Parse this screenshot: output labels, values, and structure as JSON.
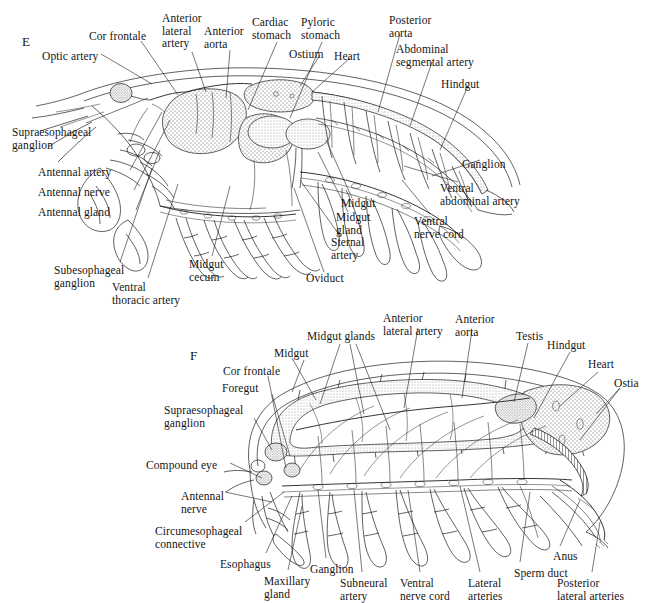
{
  "figure": {
    "panels": [
      {
        "id": "E",
        "letter": "E",
        "subject": "decapod-crustacean-internal-anatomy-lateral",
        "labels": [
          {
            "name": "optic-artery",
            "text": "Optic artery",
            "x": 42,
            "y": 50
          },
          {
            "name": "cor-frontale",
            "text": "Cor frontale",
            "x": 89,
            "y": 30
          },
          {
            "name": "anterior-lateral-artery",
            "text": "Anterior\nlateral\nartery",
            "x": 162,
            "y": 12
          },
          {
            "name": "anterior-aorta",
            "text": "Anterior\naorta",
            "x": 204,
            "y": 25
          },
          {
            "name": "cardiac-stomach",
            "text": "Cardiac\nstomach",
            "x": 252,
            "y": 16
          },
          {
            "name": "pyloric-stomach",
            "text": "Pyloric\nstomach",
            "x": 301,
            "y": 16
          },
          {
            "name": "ostium",
            "text": "Ostium",
            "x": 289,
            "y": 48
          },
          {
            "name": "heart",
            "text": "Heart",
            "x": 334,
            "y": 50
          },
          {
            "name": "posterior-aorta",
            "text": "Posterior\naorta",
            "x": 389,
            "y": 14
          },
          {
            "name": "abdominal-segmental-artery",
            "text": "Abdominal\nsegmental artery",
            "x": 396,
            "y": 43
          },
          {
            "name": "hindgut",
            "text": "Hindgut",
            "x": 441,
            "y": 78
          },
          {
            "name": "supraesophageal-ganglion",
            "text": "Supraesophageal\nganglion",
            "x": 12,
            "y": 126
          },
          {
            "name": "antennal-artery",
            "text": "Antennal artery",
            "x": 38,
            "y": 166
          },
          {
            "name": "antennal-nerve",
            "text": "Antennal nerve",
            "x": 38,
            "y": 186
          },
          {
            "name": "antennal-gland",
            "text": "Antennal gland",
            "x": 38,
            "y": 206
          },
          {
            "name": "subesophageal-ganglion",
            "text": "Subesophageal\nganglion",
            "x": 54,
            "y": 264
          },
          {
            "name": "ventral-thoracic-artery",
            "text": "Ventral\nthoracic artery",
            "x": 112,
            "y": 281
          },
          {
            "name": "midgut-cecum",
            "text": "Midgut\ncecum",
            "x": 189,
            "y": 258
          },
          {
            "name": "oviduct",
            "text": "Oviduct",
            "x": 306,
            "y": 272
          },
          {
            "name": "sternal-artery",
            "text": "Sternal\nartery",
            "x": 331,
            "y": 236
          },
          {
            "name": "midgut-gland",
            "text": "Midgut\ngland",
            "x": 336,
            "y": 211
          },
          {
            "name": "midgut",
            "text": "Midgut",
            "x": 341,
            "y": 197
          },
          {
            "name": "ventral-nerve-cord",
            "text": "Ventral\nnerve cord",
            "x": 414,
            "y": 215
          },
          {
            "name": "ventral-abdominal-artery",
            "text": "Ventral\nabdominal artery",
            "x": 440,
            "y": 182
          },
          {
            "name": "ganglion",
            "text": "Ganglion",
            "x": 462,
            "y": 158
          }
        ]
      },
      {
        "id": "F",
        "letter": "F",
        "subject": "isopod-internal-anatomy-lateral",
        "labels": [
          {
            "name": "midgut-glands",
            "text": "Midgut glands",
            "x": 307,
            "y": 330
          },
          {
            "name": "midgut",
            "text": "Midgut",
            "x": 274,
            "y": 347
          },
          {
            "name": "cor-frontale",
            "text": "Cor frontale",
            "x": 223,
            "y": 365
          },
          {
            "name": "foregut",
            "text": "Foregut",
            "x": 222,
            "y": 382
          },
          {
            "name": "supraesophageal-ganglion",
            "text": "Supraesophageal\nganglion",
            "x": 164,
            "y": 404
          },
          {
            "name": "anterior-lateral-artery",
            "text": "Anterior\nlateral artery",
            "x": 383,
            "y": 312
          },
          {
            "name": "anterior-aorta",
            "text": "Anterior\naorta",
            "x": 455,
            "y": 313
          },
          {
            "name": "testis",
            "text": "Testis",
            "x": 516,
            "y": 330
          },
          {
            "name": "hindgut",
            "text": "Hindgut",
            "x": 547,
            "y": 339
          },
          {
            "name": "heart",
            "text": "Heart",
            "x": 588,
            "y": 358
          },
          {
            "name": "ostia",
            "text": "Ostia",
            "x": 614,
            "y": 377
          },
          {
            "name": "compound-eye",
            "text": "Compound eye",
            "x": 146,
            "y": 459
          },
          {
            "name": "antennal-nerve",
            "text": "Antennal\nnerve",
            "x": 181,
            "y": 490
          },
          {
            "name": "circumesophageal-connective",
            "text": "Circumesophageal\nconnective",
            "x": 155,
            "y": 525
          },
          {
            "name": "esophagus",
            "text": "Esophagus",
            "x": 220,
            "y": 558
          },
          {
            "name": "maxillary-gland",
            "text": "Maxillary\ngland",
            "x": 264,
            "y": 575
          },
          {
            "name": "ganglion",
            "text": "Ganglion",
            "x": 310,
            "y": 563
          },
          {
            "name": "subneural-artery",
            "text": "Subneural\nartery",
            "x": 340,
            "y": 577
          },
          {
            "name": "ventral-nerve-cord",
            "text": "Ventral\nnerve cord",
            "x": 400,
            "y": 577
          },
          {
            "name": "lateral-arteries",
            "text": "Lateral\narteries",
            "x": 468,
            "y": 577
          },
          {
            "name": "sperm-duct",
            "text": "Sperm duct",
            "x": 514,
            "y": 567
          },
          {
            "name": "anus",
            "text": "Anus",
            "x": 553,
            "y": 550
          },
          {
            "name": "posterior-lateral-arteries",
            "text": "Posterior\nlateral arteries",
            "x": 557,
            "y": 577
          }
        ]
      }
    ],
    "colors": {
      "ink": "#1d1d1d",
      "background": "#ffffff",
      "stipple": "#3a3a3a"
    }
  }
}
